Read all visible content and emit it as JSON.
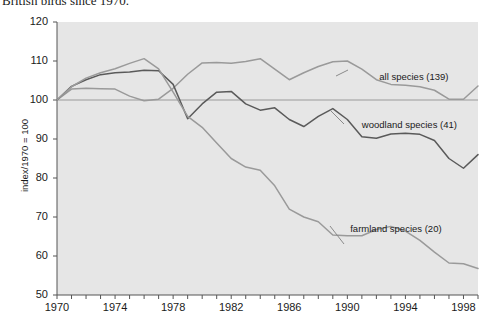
{
  "caption_fragment": "British birds since 1970.",
  "chart_data": {
    "type": "line",
    "title": "",
    "xlabel": "",
    "ylabel": "index/1970 = 100",
    "xlim": [
      1970,
      1999
    ],
    "ylim": [
      50,
      120
    ],
    "grid": false,
    "legend_position": "inline-annotations",
    "reference_line": 100,
    "plot_background": "#e6e6e6",
    "yticks": [
      120,
      110,
      100,
      90,
      80,
      70,
      60,
      50
    ],
    "xticks_major": [
      1970,
      1974,
      1978,
      1982,
      1986,
      1990,
      1994,
      1998
    ],
    "xticks_minor_every": 1,
    "x": [
      1970,
      1971,
      1972,
      1973,
      1974,
      1975,
      1976,
      1977,
      1978,
      1979,
      1980,
      1981,
      1982,
      1983,
      1984,
      1985,
      1986,
      1987,
      1988,
      1989,
      1990,
      1991,
      1992,
      1993,
      1994,
      1995,
      1996,
      1997,
      1998,
      1999
    ],
    "series": [
      {
        "name": "all species (139)",
        "label": "all species (139)",
        "color": "#9a9a9a",
        "label_x": 1992.2,
        "label_y": 106.0,
        "values": [
          100.0,
          102.8,
          103.0,
          102.9,
          102.8,
          101.0,
          99.8,
          100.2,
          103.0,
          106.6,
          109.5,
          109.6,
          109.4,
          109.9,
          110.6,
          107.9,
          105.2,
          107.0,
          108.6,
          109.8,
          110.0,
          107.9,
          105.2,
          104.0,
          103.8,
          103.4,
          102.5,
          100.2,
          100.2,
          103.6
        ]
      },
      {
        "name": "woodland species (41)",
        "label": "woodland species (41)",
        "color": "#5a5a5a",
        "label_x": 1991.0,
        "label_y": 93.5,
        "values": [
          100.0,
          103.5,
          105.2,
          106.5,
          107.0,
          107.2,
          107.6,
          107.5,
          104.0,
          95.2,
          99.0,
          102.0,
          102.2,
          99.0,
          97.4,
          98.0,
          95.0,
          93.2,
          95.8,
          97.8,
          95.0,
          90.6,
          90.2,
          91.3,
          91.5,
          91.2,
          89.6,
          85.0,
          82.5,
          86.0
        ]
      },
      {
        "name": "farmland species (20)",
        "label": "farmland species (20)",
        "color": "#9a9a9a",
        "label_x": 1990.2,
        "label_y": 67.0,
        "values": [
          100.0,
          103.4,
          105.6,
          107.0,
          108.0,
          109.4,
          110.6,
          108.0,
          102.0,
          95.8,
          93.0,
          89.0,
          85.0,
          82.8,
          82.0,
          78.0,
          72.0,
          70.0,
          68.8,
          65.4,
          65.2,
          65.2,
          66.8,
          67.6,
          66.4,
          64.0,
          61.0,
          58.2,
          58.0,
          56.8
        ]
      }
    ]
  }
}
